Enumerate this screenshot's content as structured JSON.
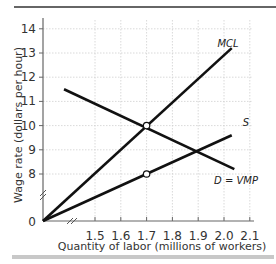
{
  "chart_data": {
    "type": "line",
    "title": "",
    "xlabel": "Quantity of labor (millions of workers)",
    "ylabel": "Wage rate (dollars per hour)",
    "xlim": [
      1.4,
      2.1
    ],
    "ylim": [
      7.5,
      14.5
    ],
    "x_axis_break": true,
    "y_axis_break": true,
    "origin_label": "0",
    "x_ticks": [
      "1.5",
      "1.6",
      "1.7",
      "1.8",
      "1.9",
      "2.0",
      "2.1"
    ],
    "y_ticks": [
      "8",
      "9",
      "10",
      "11",
      "12",
      "13",
      "14"
    ],
    "grid": true,
    "series": [
      {
        "name": "MCL",
        "label": "MCL",
        "points": [
          [
            0,
            0
          ],
          [
            2.03,
            13.2
          ]
        ]
      },
      {
        "name": "D = VMP",
        "label": "D = VMP",
        "points": [
          [
            1.38,
            11.5
          ],
          [
            2.04,
            8.2
          ]
        ]
      },
      {
        "name": "S",
        "label": "S",
        "points": [
          [
            0,
            0
          ],
          [
            2.03,
            9.6
          ]
        ]
      }
    ],
    "markers": [
      {
        "x": 1.7,
        "y": 10,
        "style": "open-circle",
        "note": "MCL = VMP"
      },
      {
        "x": 1.7,
        "y": 8,
        "style": "open-circle",
        "note": "wage on supply curve"
      }
    ]
  }
}
